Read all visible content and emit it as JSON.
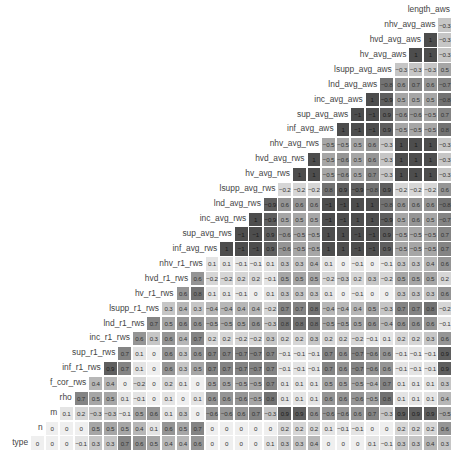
{
  "chart_data": {
    "type": "heatmap",
    "title": "",
    "subtype": "lower-triangular correlation matrix",
    "color_scale": {
      "low_abs": "#efefef",
      "high_abs": "#4d4d4d",
      "metric": "absolute correlation"
    },
    "variables": [
      "length_aws",
      "nhv_avg_aws",
      "hvd_avg_aws",
      "hv_avg_aws",
      "lsupp_avg_aws",
      "lnd_avg_aws",
      "inc_avg_aws",
      "sup_avg_aws",
      "inf_avg_aws",
      "nhv_avg_rws",
      "hvd_avg_rws",
      "hv_avg_rws",
      "lsupp_avg_rws",
      "lnd_avg_rws",
      "inc_avg_rws",
      "sup_avg_rws",
      "inf_avg_rws",
      "nhv_r1_rws",
      "hvd_r1_rws",
      "hv_r1_rws",
      "lsupp_r1_rws",
      "lnd_r1_rws",
      "inc_r1_rws",
      "sup_r1_rws",
      "inf_r1_rws",
      "f_cor_rws",
      "rho",
      "m",
      "n",
      "type"
    ],
    "rows": [
      {
        "label": "length_aws",
        "values": []
      },
      {
        "label": "nhv_avg_aws",
        "values": [
          -0.3
        ]
      },
      {
        "label": "hvd_avg_aws",
        "values": [
          1,
          -0.3
        ]
      },
      {
        "label": "hv_avg_aws",
        "values": [
          1,
          1,
          -0.3
        ]
      },
      {
        "label": "lsupp_avg_aws",
        "values": [
          -0.3,
          -0.3,
          -0.3,
          0.5
        ]
      },
      {
        "label": "lnd_avg_aws",
        "values": [
          -0.8,
          0.6,
          0.7,
          0.6,
          -0.7
        ]
      },
      {
        "label": "inc_avg_aws",
        "values": [
          1,
          -0.9,
          0.5,
          0.5,
          0.5,
          -0.8
        ]
      },
      {
        "label": "sup_avg_aws",
        "values": [
          -1,
          -1,
          0.9,
          -0.6,
          -0.6,
          -0.5,
          0.7
        ]
      },
      {
        "label": "inf_avg_aws",
        "values": [
          1,
          -1,
          -1,
          0.9,
          -0.5,
          -0.5,
          -0.5,
          0.8
        ]
      },
      {
        "label": "nhv_avg_rws",
        "values": [
          -0.5,
          -0.5,
          0.5,
          0.6,
          -0.3,
          1,
          1,
          1,
          -0.3
        ]
      },
      {
        "label": "hvd_avg_rws",
        "values": [
          1,
          -0.5,
          -0.6,
          0.5,
          0.6,
          -0.3,
          1,
          1,
          1,
          -0.3
        ]
      },
      {
        "label": "hv_avg_rws",
        "values": [
          1,
          1,
          -0.5,
          -0.6,
          0.5,
          0.7,
          -0.3,
          1,
          1,
          1,
          -0.3
        ]
      },
      {
        "label": "lsupp_avg_rws",
        "values": [
          -0.2,
          -0.2,
          -0.2,
          0.8,
          0.9,
          -0.9,
          -0.8,
          0.9,
          -0.2,
          -0.2,
          -0.2,
          0.6
        ]
      },
      {
        "label": "lnd_avg_rws",
        "values": [
          -0.9,
          0.6,
          0.6,
          0.6,
          -1,
          -1,
          1,
          1,
          -0.8,
          0.6,
          0.6,
          0.6,
          -0.8
        ]
      },
      {
        "label": "inc_avg_rws",
        "values": [
          1,
          -0.9,
          0.5,
          0.5,
          0.5,
          -1,
          -1,
          1,
          1,
          -0.9,
          0.5,
          0.6,
          0.5,
          -0.7
        ]
      },
      {
        "label": "sup_avg_rws",
        "values": [
          -1,
          -1,
          0.9,
          -0.6,
          -0.5,
          -0.5,
          1,
          1,
          -1,
          -1,
          0.9,
          -0.5,
          -0.5,
          -0.5,
          0.7
        ]
      },
      {
        "label": "inf_avg_rws",
        "values": [
          1,
          -1,
          -1,
          0.9,
          -0.6,
          -0.5,
          -0.5,
          1,
          1,
          -1,
          -1,
          0.9,
          -0.5,
          -0.5,
          -0.5,
          0.7
        ]
      },
      {
        "label": "nhv_r1_rws",
        "values": [
          0.1,
          0.1,
          -0.1,
          -0.1,
          0.1,
          0.3,
          0.3,
          0.4,
          0.1,
          0,
          -0.1,
          0,
          -0.1,
          0.3,
          0.3,
          0.4,
          0.6
        ]
      },
      {
        "label": "hvd_r1_rws",
        "values": [
          0.6,
          -0.2,
          -0.2,
          0.2,
          0.2,
          -0.1,
          0.5,
          0.5,
          0.5,
          -0.2,
          -0.3,
          0.2,
          0.3,
          -0.2,
          0.5,
          0.5,
          0.5,
          0.2
        ]
      },
      {
        "label": "hv_r1_rws",
        "values": [
          0.6,
          0.8,
          0.1,
          0.1,
          -0.1,
          0,
          0.1,
          0.3,
          0.3,
          0.3,
          0.1,
          0,
          -0.1,
          0,
          0,
          0.3,
          0.3,
          0.3,
          0.6
        ]
      },
      {
        "label": "lsupp_r1_rws",
        "values": [
          0.3,
          0.4,
          0.3,
          -0.4,
          -0.4,
          0.4,
          0.4,
          -0.2,
          0.7,
          0.7,
          0.8,
          -0.4,
          -0.4,
          0.4,
          0.5,
          -0.3,
          0.7,
          0.7,
          0.8,
          -0.2
        ]
      },
      {
        "label": "lnd_r1_rws",
        "values": [
          0.7,
          0.5,
          0.6,
          0.6,
          -0.5,
          -0.5,
          0.5,
          0.6,
          -0.3,
          0.8,
          0.8,
          0.8,
          -0.5,
          -0.5,
          0.5,
          0.6,
          -0.4,
          0.6,
          0.6,
          0.6,
          -0.1
        ]
      },
      {
        "label": "inc_r1_rws",
        "values": [
          0.6,
          0.3,
          0.6,
          0.4,
          0.7,
          0.2,
          0.2,
          -0.2,
          -0.2,
          0.3,
          0.2,
          0.2,
          0.3,
          0.2,
          0.2,
          -0.2,
          -0.1,
          0.1,
          0.2,
          0.2,
          0.3,
          0.6
        ]
      },
      {
        "label": "sup_r1_rws",
        "values": [
          0.7,
          0.1,
          0,
          0.6,
          0.3,
          0.6,
          0.7,
          0.7,
          -0.7,
          -0.7,
          0.7,
          -0.1,
          -0.1,
          -0.1,
          0.7,
          0.6,
          -0.7,
          -0.6,
          0.6,
          -0.1,
          -0.1,
          -0.1,
          0.9
        ]
      },
      {
        "label": "inf_r1_rws",
        "values": [
          0.9,
          0.7,
          0.1,
          0,
          0.6,
          0.3,
          0.5,
          0.7,
          0.7,
          -0.7,
          -0.7,
          0.7,
          -0.1,
          -0.1,
          -0.1,
          0.7,
          0.6,
          -0.7,
          -0.6,
          0.6,
          -0.1,
          -0.1,
          -0.1,
          0.9
        ]
      },
      {
        "label": "f_cor_rws",
        "values": [
          0.4,
          0.4,
          0,
          -0.2,
          0,
          0.2,
          0.1,
          0,
          0.5,
          0.5,
          -0.5,
          -0.5,
          0.7,
          0.1,
          0.1,
          0.1,
          0.5,
          0.5,
          -0.5,
          -0.4,
          0.7,
          0.1,
          0.1,
          0.1,
          0.3
        ]
      },
      {
        "label": "rho",
        "values": [
          0.7,
          0.5,
          0.5,
          0.1,
          -0.1,
          0,
          0.1,
          0,
          0.1,
          0.6,
          0.6,
          -0.6,
          -0.5,
          0.8,
          0.1,
          0.1,
          0.1,
          0.6,
          0.6,
          -0.6,
          -0.5,
          0.8,
          0.1,
          0.1,
          0.1,
          0.4
        ]
      },
      {
        "label": "m",
        "values": [
          0.1,
          0.2,
          -0.3,
          -0.3,
          -0.1,
          0.5,
          0.6,
          0.1,
          0.3,
          0,
          -0.6,
          -0.6,
          0.6,
          0.7,
          -0.3,
          0.9,
          0.9,
          0.6,
          -0.6,
          -0.6,
          0.6,
          0.7,
          -0.3,
          0.9,
          0.9,
          0.9,
          -0.5
        ]
      },
      {
        "label": "n",
        "values": [
          0,
          0,
          0,
          0.5,
          0.5,
          0.5,
          0.4,
          0.1,
          0.6,
          0.5,
          0.7,
          0,
          0,
          0,
          0,
          0,
          0.2,
          0.2,
          0.2,
          0.1,
          -0.1,
          -0.1,
          0,
          0,
          0.2,
          0.2,
          0.2,
          0.6
        ]
      },
      {
        "label": "type",
        "values": [
          0,
          0,
          0,
          -0.1,
          0.3,
          0.3,
          0.7,
          0.6,
          0.5,
          0.4,
          0.4,
          0.6,
          0,
          0,
          0,
          0,
          0.1,
          0.3,
          0.3,
          0.4,
          0,
          0,
          0,
          0.1,
          -0.1,
          0.3,
          0.3,
          0.4,
          0.3
        ]
      }
    ],
    "xlabel": "",
    "ylabel": "",
    "legend": "none",
    "grid": false
  }
}
